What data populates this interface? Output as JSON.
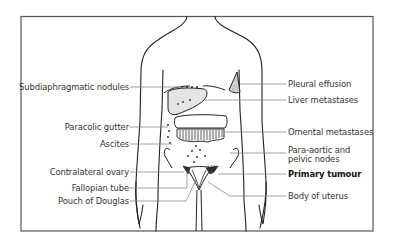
{
  "diagram": {
    "labels_left": [
      {
        "id": "subdiaphragmatic",
        "text": "Subdiaphragmatic nodules"
      },
      {
        "id": "paracolic",
        "text": "Paracolic gutter"
      },
      {
        "id": "ascites",
        "text": "Ascites"
      },
      {
        "id": "contralateral",
        "text": "Contralateral ovary"
      },
      {
        "id": "fallopian",
        "text": "Fallopian tube"
      },
      {
        "id": "pouch",
        "text": "Pouch of Douglas"
      }
    ],
    "labels_right": [
      {
        "id": "pleural",
        "text": "Pleural effusion"
      },
      {
        "id": "liver",
        "text": "Liver metastases"
      },
      {
        "id": "omental",
        "text": "Omental metastases"
      },
      {
        "id": "paraaortic_1",
        "text": "Para-aortic and"
      },
      {
        "id": "paraaortic_2",
        "text": "pelvic nodes"
      },
      {
        "id": "primary",
        "text": "Primary tumour",
        "bold": true
      },
      {
        "id": "uterus",
        "text": "Body of uterus"
      }
    ],
    "colors": {
      "line": "#222222",
      "leader": "#888888",
      "fill": "#e4e4e4",
      "border": "#555555"
    }
  }
}
